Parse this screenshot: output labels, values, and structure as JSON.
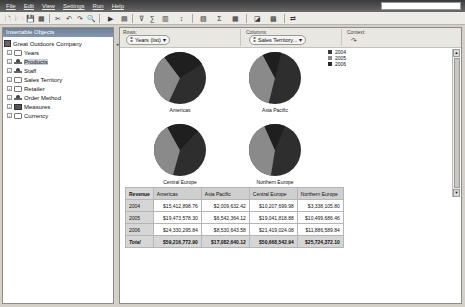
{
  "menubar": {
    "items": [
      "File",
      "Edit",
      "View",
      "Settings",
      "Run",
      "Help"
    ]
  },
  "toolbar": {
    "buttons": [
      "new-icon",
      "open-icon",
      "save-icon",
      "save-as-icon",
      "cut-icon",
      "undo-icon",
      "redo-icon",
      "find-icon",
      "run-icon",
      "export-icon",
      "filter-icon",
      "sum-icon",
      "rank-icon",
      "sort-icon",
      "chart-icon",
      "layout-icon",
      "calculation-icon",
      "explore-icon",
      "swap-icon",
      "properties-icon"
    ],
    "glyphs": [
      "🗋",
      "🗁",
      "💾",
      "▦",
      "✂",
      "↶",
      "↷",
      "🔍",
      "▶",
      "▤",
      "⊽",
      "∑",
      "▥",
      "↕",
      "▨",
      "Σ",
      "▦",
      "◪",
      "▩",
      "⇄"
    ]
  },
  "left_panel": {
    "title": "Insertable Objects",
    "root": "Great Outdoors Company",
    "items": [
      {
        "label": "Years",
        "type": "folder",
        "selected": false
      },
      {
        "label": "Products",
        "type": "dimension",
        "selected": true
      },
      {
        "label": "Staff",
        "type": "dimension",
        "selected": false
      },
      {
        "label": "Sales Territory",
        "type": "folder",
        "selected": false
      },
      {
        "label": "Retailer",
        "type": "folder",
        "selected": false
      },
      {
        "label": "Order Method",
        "type": "dimension",
        "selected": false
      },
      {
        "label": "Measures",
        "type": "measure",
        "selected": false
      },
      {
        "label": "Currency",
        "type": "folder",
        "selected": false
      }
    ]
  },
  "drop_zones": {
    "rows_label": "Rows:",
    "rows_value": "Years (list)",
    "columns_label": "Columns:",
    "columns_value": "Sales Territory...",
    "context_label": "Context:"
  },
  "chart_data": {
    "type": "pie",
    "title": "",
    "legend": [
      "2004",
      "2005",
      "2006"
    ],
    "legend_colors": [
      "#3a3a3a",
      "#8a8a8a",
      "#2a2a2a"
    ],
    "legend_position": "top-right",
    "pies": [
      {
        "name": "Americas",
        "values": [
          15412898.76,
          19473578.3,
          24330295.84
        ]
      },
      {
        "name": "Asia Pacific",
        "values": [
          2009632.42,
          6542364.12,
          8530643.58
        ]
      },
      {
        "name": "Central Europe",
        "values": [
          10207699.98,
          19041818.88,
          21419024.08
        ]
      },
      {
        "name": "Northern Europe",
        "values": [
          3338105.8,
          10499686.46,
          11886589.84
        ]
      }
    ]
  },
  "table": {
    "corner": "Revenue",
    "columns": [
      "Americas",
      "Asia Pacific",
      "Central Europe",
      "Northern Europe"
    ],
    "rows": [
      {
        "label": "2004",
        "values": [
          "$15,412,898.76",
          "$2,009,632.42",
          "$10,207,699.98",
          "$3,338,105.80"
        ]
      },
      {
        "label": "2005",
        "values": [
          "$19,473,578.30",
          "$6,542,364.12",
          "$19,041,818.88",
          "$10,499,686.46"
        ]
      },
      {
        "label": "2006",
        "values": [
          "$24,330,295.84",
          "$8,530,643.58",
          "$21,419,024.08",
          "$11,886,589.84"
        ]
      }
    ],
    "total": {
      "label": "Total",
      "values": [
        "$59,216,772.90",
        "$17,082,640.12",
        "$50,668,542.94",
        "$25,724,372.10"
      ]
    }
  }
}
